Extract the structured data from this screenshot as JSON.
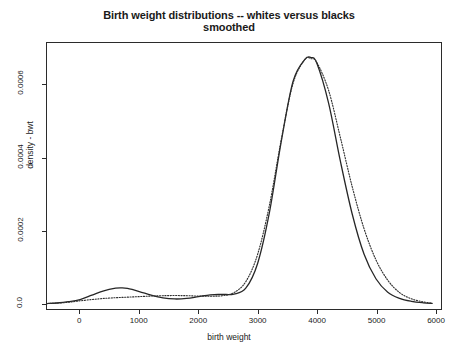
{
  "chart_data": {
    "type": "line",
    "title": "Birth weight distributions -- whites versus blacks",
    "subtitle": "smoothed",
    "xlabel": "birth weight",
    "ylabel": "density - bwt",
    "xlim": [
      -560,
      6100
    ],
    "ylim": [
      -1.5e-05,
      0.000715
    ],
    "xticks": [
      "0",
      "1000",
      "2000",
      "3000",
      "4000",
      "5000",
      "6000"
    ],
    "xtick_values": [
      0,
      1000,
      2000,
      3000,
      4000,
      5000,
      6000
    ],
    "yticks": [
      "0.0",
      "0.0002",
      "0.0004",
      "0.0006"
    ],
    "ytick_values": [
      0,
      0.0002,
      0.0004,
      0.0006
    ],
    "grid": false,
    "legend": "none",
    "series": [
      {
        "name": "blacks",
        "style": "solid",
        "color": "#262626",
        "x": [
          -560,
          -400,
          -200,
          0,
          200,
          400,
          600,
          700,
          800,
          1000,
          1200,
          1400,
          1600,
          1800,
          2000,
          2200,
          2400,
          2600,
          2800,
          3000,
          3200,
          3400,
          3600,
          3800,
          3900,
          4000,
          4200,
          4400,
          4600,
          4800,
          5000,
          5200,
          5400,
          5600,
          5800,
          5950
        ],
        "y": [
          0.0,
          1.5e-06,
          5e-06,
          1.1e-05,
          2.3e-05,
          3.5e-05,
          4.2e-05,
          4.3e-05,
          4.15e-05,
          3.3e-05,
          2.3e-05,
          1.55e-05,
          1.25e-05,
          1.4e-05,
          1.9e-05,
          2.4e-05,
          2.5e-05,
          2.6e-05,
          4.2e-05,
          0.00011,
          0.00025,
          0.000445,
          0.00061,
          0.00067,
          0.000675,
          0.00066,
          0.00055,
          0.00039,
          0.000245,
          0.000135,
          6.8e-05,
          3.1e-05,
          1.4e-05,
          6e-06,
          2e-06,
          5e-07
        ]
      },
      {
        "name": "whites",
        "style": "dotted",
        "color": "#303030",
        "x": [
          -560,
          -400,
          -200,
          0,
          200,
          400,
          600,
          800,
          1000,
          1200,
          1400,
          1600,
          1800,
          2000,
          2200,
          2400,
          2600,
          2800,
          3000,
          3200,
          3400,
          3600,
          3800,
          3900,
          4000,
          4200,
          4400,
          4600,
          4800,
          5000,
          5200,
          5400,
          5600,
          5800,
          5950
        ],
        "y": [
          0.0,
          1e-06,
          3.5e-06,
          7.5e-06,
          1.1e-05,
          1.4e-05,
          1.6e-05,
          1.75e-05,
          1.9e-05,
          2.05e-05,
          2.15e-05,
          2.2e-05,
          2.15e-05,
          2.05e-05,
          2e-05,
          2.15e-05,
          3e-05,
          6e-05,
          0.000135,
          0.00027,
          0.00045,
          0.000605,
          0.00067,
          0.000672,
          0.000662,
          0.000585,
          0.000455,
          0.00032,
          0.000205,
          0.00012,
          6.4e-05,
          3e-05,
          1.3e-05,
          4.5e-06,
          1e-06
        ]
      }
    ]
  },
  "caption": ""
}
